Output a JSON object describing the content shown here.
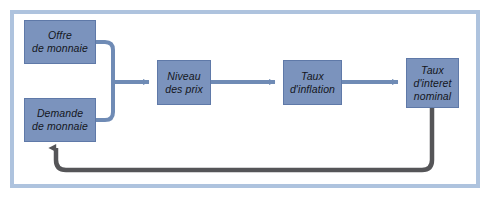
{
  "diagram": {
    "type": "flow-diagram",
    "frame": {
      "border_color": "#aec3de",
      "background_color": "#ffffff"
    },
    "style": {
      "node_fill": "#7b93bd",
      "node_border": "#5f79a8",
      "node_text_color": "#14161c",
      "primary_arrow_color": "#6f8bb5",
      "feedback_arrow_color": "#555558"
    },
    "nodes": [
      {
        "id": "offre-de-monnaie",
        "label": "Offre\nde monnaie",
        "x": 24,
        "y": 20,
        "width": 72,
        "height": 44
      },
      {
        "id": "demande-de-monnaie",
        "label": "Demande\nde monnaie",
        "x": 24,
        "y": 98,
        "width": 72,
        "height": 44
      },
      {
        "id": "niveau-des-prix",
        "label": "Niveau\ndes prix",
        "x": 157,
        "y": 60,
        "width": 54,
        "height": 45
      },
      {
        "id": "taux-d-inflation",
        "label": "Taux\nd'inflation",
        "x": 283,
        "y": 60,
        "width": 59,
        "height": 45
      },
      {
        "id": "taux-d-interet-nominal",
        "label": "Taux\nd'interet\nnominal",
        "x": 406,
        "y": 58,
        "width": 53,
        "height": 50
      }
    ],
    "edges": [
      {
        "id": "offre-to-niveau",
        "from": "offre-de-monnaie",
        "to": "niveau-des-prix",
        "kind": "primary",
        "arrowhead": true
      },
      {
        "id": "demande-to-niveau",
        "from": "demande-de-monnaie",
        "to": "niveau-des-prix",
        "kind": "primary",
        "arrowhead": true
      },
      {
        "id": "niveau-to-inflation",
        "from": "niveau-des-prix",
        "to": "taux-d-inflation",
        "kind": "primary",
        "arrowhead": true
      },
      {
        "id": "inflation-to-taux-nominal",
        "from": "taux-d-inflation",
        "to": "taux-d-interet-nominal",
        "kind": "primary",
        "arrowhead": true
      },
      {
        "id": "taux-nominal-to-demande-feedback",
        "from": "taux-d-interet-nominal",
        "to": "demande-de-monnaie",
        "kind": "feedback",
        "arrowhead": true
      }
    ]
  }
}
